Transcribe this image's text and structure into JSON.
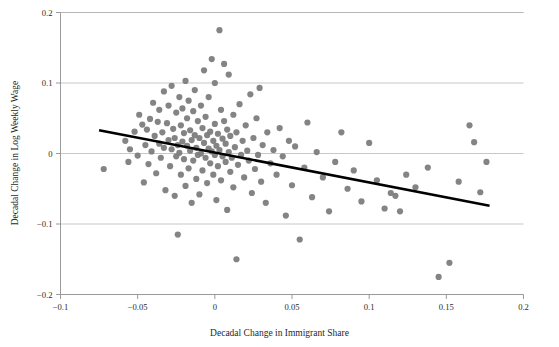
{
  "figure": {
    "top_caption": "",
    "background_color": "#ffffff"
  },
  "chart_data": {
    "type": "scatter",
    "title": "",
    "xlabel": "Decadal Change in Immigrant Share",
    "ylabel": "Decadal Change in Log Weekly Wage",
    "xlim": [
      -0.1,
      0.2
    ],
    "ylim": [
      -0.2,
      0.2
    ],
    "xticks": [
      -0.1,
      -0.05,
      0,
      0.05,
      0.1,
      0.15,
      0.2
    ],
    "xtick_labels": [
      "−0.1",
      "−0.05",
      "0",
      "0.05",
      "0.1",
      "0.15",
      "0.2"
    ],
    "yticks": [
      -0.2,
      -0.1,
      0,
      0.1,
      0.2
    ],
    "ytick_labels": [
      "−0.2",
      "−0.1",
      "0",
      "0.1",
      "0.2"
    ],
    "grid": "horizontal",
    "grid_color": "#b0b0b0",
    "axis_color": "#8f8f8f",
    "marker": {
      "shape": "circle",
      "color": "#7d7d7d",
      "radius_px": 3.1,
      "opacity": 0.95
    },
    "fit_line": {
      "label": "linear fit",
      "color": "#000000",
      "width_px": 2.6,
      "x_start": -0.075,
      "y_start": 0.033,
      "x_end": 0.178,
      "y_end": -0.074,
      "slope": -0.423,
      "intercept": 0.0013
    },
    "points": [
      [
        -0.072,
        -0.022
      ],
      [
        -0.058,
        0.018
      ],
      [
        -0.056,
        -0.012
      ],
      [
        -0.055,
        0.006
      ],
      [
        -0.052,
        0.031
      ],
      [
        -0.05,
        -0.003
      ],
      [
        -0.049,
        0.055
      ],
      [
        -0.047,
        0.041
      ],
      [
        -0.046,
        -0.041
      ],
      [
        -0.045,
        0.012
      ],
      [
        -0.044,
        0.034
      ],
      [
        -0.043,
        -0.015
      ],
      [
        -0.042,
        0.049
      ],
      [
        -0.041,
        0.003
      ],
      [
        -0.04,
        0.072
      ],
      [
        -0.039,
        0.025
      ],
      [
        -0.038,
        -0.028
      ],
      [
        -0.037,
        0.045
      ],
      [
        -0.036,
        0.014
      ],
      [
        -0.036,
        0.062
      ],
      [
        -0.035,
        -0.006
      ],
      [
        -0.034,
        0.03
      ],
      [
        -0.033,
        0.088
      ],
      [
        -0.033,
        0.008
      ],
      [
        -0.032,
        -0.052
      ],
      [
        -0.031,
        0.043
      ],
      [
        -0.03,
        0.019
      ],
      [
        -0.03,
        0.068
      ],
      [
        -0.029,
        -0.018
      ],
      [
        -0.028,
        0.006
      ],
      [
        -0.028,
        0.096
      ],
      [
        -0.027,
        0.035
      ],
      [
        -0.026,
        -0.06
      ],
      [
        -0.026,
        0.022
      ],
      [
        -0.025,
        0.058
      ],
      [
        -0.025,
        -0.004
      ],
      [
        -0.024,
        0.012
      ],
      [
        -0.024,
        -0.115
      ],
      [
        -0.023,
        0.08
      ],
      [
        -0.023,
        0.001
      ],
      [
        -0.022,
        0.04
      ],
      [
        -0.022,
        -0.03
      ],
      [
        -0.021,
        0.017
      ],
      [
        -0.021,
        0.064
      ],
      [
        -0.02,
        -0.008
      ],
      [
        -0.02,
        0.029
      ],
      [
        -0.019,
        0.103
      ],
      [
        -0.019,
        -0.046
      ],
      [
        -0.018,
        0.011
      ],
      [
        -0.018,
        0.05
      ],
      [
        -0.017,
        -0.021
      ],
      [
        -0.017,
        0.075
      ],
      [
        -0.016,
        0.004
      ],
      [
        -0.016,
        0.033
      ],
      [
        -0.015,
        -0.07
      ],
      [
        -0.015,
        0.019
      ],
      [
        -0.014,
        0.06
      ],
      [
        -0.014,
        -0.01
      ],
      [
        -0.013,
        0.026
      ],
      [
        -0.013,
        0.09
      ],
      [
        -0.012,
        -0.036
      ],
      [
        -0.012,
        0.008
      ],
      [
        -0.011,
        0.046
      ],
      [
        -0.011,
        -0.002
      ],
      [
        -0.01,
        0.022
      ],
      [
        -0.01,
        -0.058
      ],
      [
        -0.009,
        0.068
      ],
      [
        -0.009,
        0.0
      ],
      [
        -0.008,
        0.036
      ],
      [
        -0.008,
        -0.024
      ],
      [
        -0.007,
        0.015
      ],
      [
        -0.007,
        0.118
      ],
      [
        -0.006,
        -0.006
      ],
      [
        -0.006,
        0.052
      ],
      [
        -0.005,
        0.026
      ],
      [
        -0.005,
        -0.042
      ],
      [
        -0.004,
        0.007
      ],
      [
        -0.004,
        0.08
      ],
      [
        -0.003,
        -0.014
      ],
      [
        -0.003,
        0.031
      ],
      [
        -0.002,
        0.003
      ],
      [
        -0.002,
        0.134
      ],
      [
        -0.001,
        -0.03
      ],
      [
        -0.001,
        0.018
      ],
      [
        0.0,
        -0.002
      ],
      [
        0.0,
        0.042
      ],
      [
        0.0,
        0.1
      ],
      [
        0.001,
        -0.066
      ],
      [
        0.001,
        0.011
      ],
      [
        0.002,
        0.028
      ],
      [
        0.002,
        -0.018
      ],
      [
        0.003,
        0.175
      ],
      [
        0.003,
        0.005
      ],
      [
        0.004,
        0.062
      ],
      [
        0.004,
        -0.038
      ],
      [
        0.005,
        0.021
      ],
      [
        0.005,
        -0.004
      ],
      [
        0.006,
        0.046
      ],
      [
        0.006,
        0.127
      ],
      [
        0.007,
        -0.012
      ],
      [
        0.007,
        0.014
      ],
      [
        0.008,
        -0.08
      ],
      [
        0.008,
        0.034
      ],
      [
        0.009,
        0.002
      ],
      [
        0.009,
        0.112
      ],
      [
        0.01,
        -0.026
      ],
      [
        0.01,
        0.025
      ],
      [
        0.011,
        -0.006
      ],
      [
        0.012,
        0.055
      ],
      [
        0.012,
        -0.048
      ],
      [
        0.013,
        0.009
      ],
      [
        0.014,
        -0.15
      ],
      [
        0.014,
        0.03
      ],
      [
        0.015,
        -0.016
      ],
      [
        0.016,
        0.07
      ],
      [
        0.017,
        -0.002
      ],
      [
        0.018,
        0.018
      ],
      [
        0.019,
        -0.034
      ],
      [
        0.02,
        0.04
      ],
      [
        0.021,
        0.004
      ],
      [
        0.022,
        -0.01
      ],
      [
        0.023,
        0.084
      ],
      [
        0.024,
        -0.056
      ],
      [
        0.025,
        0.022
      ],
      [
        0.026,
        -0.022
      ],
      [
        0.027,
        0.05
      ],
      [
        0.028,
        -0.002
      ],
      [
        0.029,
        0.093
      ],
      [
        0.03,
        -0.04
      ],
      [
        0.031,
        0.012
      ],
      [
        0.033,
        -0.07
      ],
      [
        0.034,
        0.03
      ],
      [
        0.036,
        -0.014
      ],
      [
        0.038,
        0.005
      ],
      [
        0.04,
        -0.03
      ],
      [
        0.042,
        0.036
      ],
      [
        0.044,
        -0.004
      ],
      [
        0.046,
        -0.088
      ],
      [
        0.048,
        0.018
      ],
      [
        0.05,
        -0.045
      ],
      [
        0.052,
        0.01
      ],
      [
        0.055,
        -0.122
      ],
      [
        0.058,
        -0.02
      ],
      [
        0.06,
        0.044
      ],
      [
        0.063,
        -0.062
      ],
      [
        0.066,
        0.002
      ],
      [
        0.07,
        -0.034
      ],
      [
        0.074,
        -0.082
      ],
      [
        0.078,
        -0.012
      ],
      [
        0.082,
        0.03
      ],
      [
        0.086,
        -0.05
      ],
      [
        0.09,
        -0.024
      ],
      [
        0.095,
        -0.068
      ],
      [
        0.1,
        0.015
      ],
      [
        0.105,
        -0.038
      ],
      [
        0.11,
        -0.078
      ],
      [
        0.114,
        -0.056
      ],
      [
        0.117,
        -0.06
      ],
      [
        0.12,
        -0.082
      ],
      [
        0.124,
        -0.03
      ],
      [
        0.13,
        -0.048
      ],
      [
        0.138,
        -0.02
      ],
      [
        0.145,
        -0.175
      ],
      [
        0.152,
        -0.155
      ],
      [
        0.158,
        -0.04
      ],
      [
        0.165,
        0.04
      ],
      [
        0.168,
        0.016
      ],
      [
        0.172,
        -0.055
      ],
      [
        0.176,
        -0.012
      ]
    ]
  }
}
